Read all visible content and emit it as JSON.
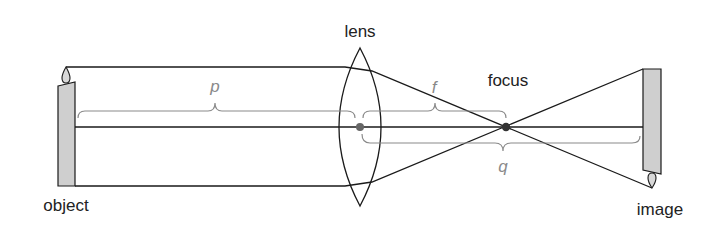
{
  "labels": {
    "lens": "lens",
    "focus": "focus",
    "object": "object",
    "image": "image"
  },
  "variables": {
    "object_distance": "p",
    "focal_length": "f",
    "image_distance": "q"
  },
  "colors": {
    "line": "#1a1a1a",
    "brace": "#8a8a8a",
    "candle_fill": "#cfcfcf",
    "point": "#555555"
  }
}
